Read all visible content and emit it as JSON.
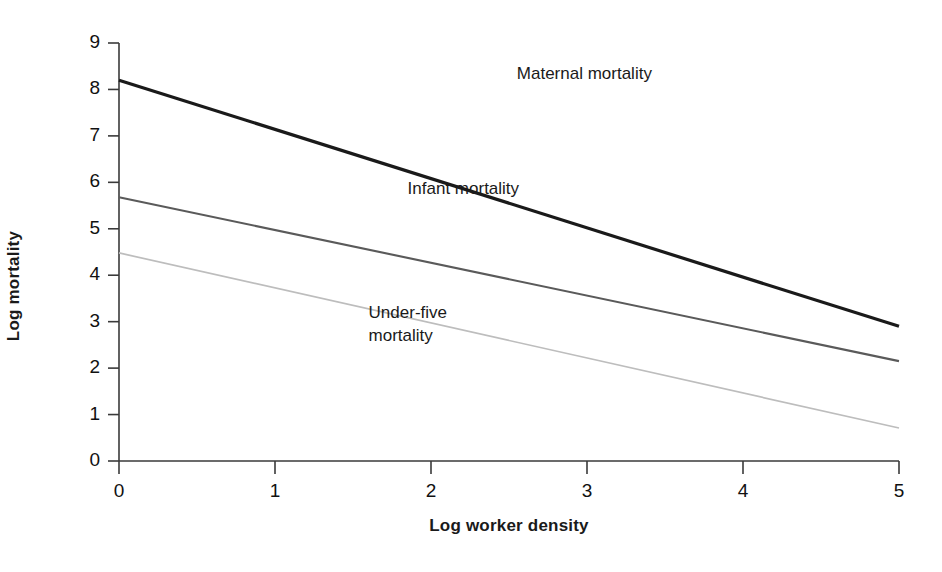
{
  "chart_data": {
    "type": "line",
    "title": "",
    "subtitle": "",
    "xlabel": "Log worker density",
    "ylabel": "Log mortality",
    "xlim": [
      0,
      5
    ],
    "ylim": [
      0,
      9
    ],
    "x_ticks": [
      "0",
      "1",
      "2",
      "3",
      "4",
      "5"
    ],
    "y_ticks": [
      "0",
      "1",
      "2",
      "3",
      "4",
      "5",
      "6",
      "7",
      "8",
      "9"
    ],
    "grid": false,
    "legend_position": "inline-annotations",
    "x": [
      0,
      5
    ],
    "series": [
      {
        "name": "Maternal mortality",
        "values": [
          8.2,
          2.9
        ],
        "color": "#1a1a1a",
        "width": 3.2,
        "label_x": 2.55,
        "label_y": 8.58
      },
      {
        "name": "Infant mortality",
        "values": [
          5.68,
          2.15
        ],
        "color": "#5a5a5a",
        "width": 2.1,
        "label_x": 1.85,
        "label_y": 6.1
      },
      {
        "name": "Under-five\nmortality",
        "values": [
          4.48,
          0.71
        ],
        "color": "#bdbdbd",
        "width": 1.7,
        "label_x": 1.6,
        "label_y": 3.42
      }
    ],
    "annotations": [
      {
        "text": "Maternal mortality"
      },
      {
        "text": "Infant mortality"
      },
      {
        "text": "Under-five mortality"
      }
    ],
    "axis_color": "#3a3a3a"
  }
}
